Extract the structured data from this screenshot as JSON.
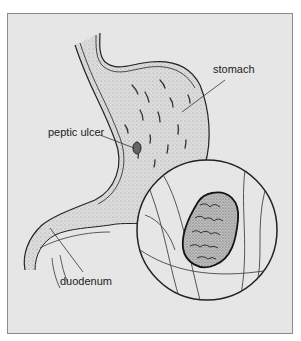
{
  "figure": {
    "title": "",
    "labels": {
      "stomach": "stomach",
      "peptic_ulcer": "peptic ulcer",
      "duodenum": "duodenum"
    },
    "colors": {
      "background": "#e6e6e6",
      "frame_border": "#8a8a8a",
      "ink": "#222222"
    }
  }
}
